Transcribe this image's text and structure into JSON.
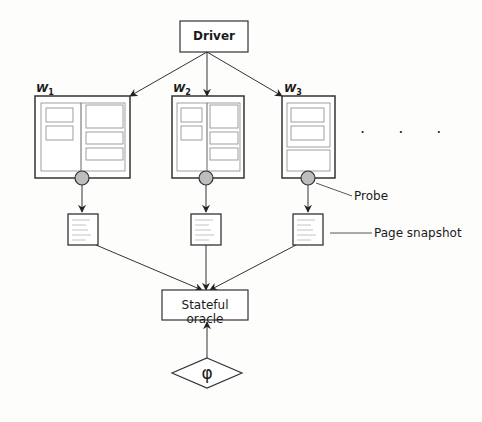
{
  "driver": {
    "label": "Driver"
  },
  "workers": [
    {
      "label": "W",
      "subscript": "1"
    },
    {
      "label": "W",
      "subscript": "2"
    },
    {
      "label": "W",
      "subscript": "3"
    }
  ],
  "ellipsis": ". . .",
  "annotations": {
    "probe": "Probe",
    "page_snapshot": "Page snapshot"
  },
  "oracle": {
    "label": "Stateful oracle"
  },
  "property": {
    "label": "φ"
  },
  "colors": {
    "stroke": "#333333",
    "inner_stroke": "#777777",
    "probe_fill": "#bdbdbd",
    "background": "#fdfdfc"
  }
}
